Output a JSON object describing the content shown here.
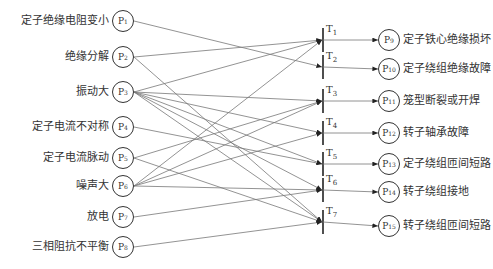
{
  "inputs": [
    {
      "id": "P1",
      "label": "定子绝缘电阻变小",
      "y": 21
    },
    {
      "id": "P2",
      "label": "绝缘分解",
      "y": 57
    },
    {
      "id": "P3",
      "label": "振动大",
      "y": 92
    },
    {
      "id": "P4",
      "label": "定子电流不对称",
      "y": 127
    },
    {
      "id": "P5",
      "label": "定子电流脉动",
      "y": 158
    },
    {
      "id": "P6",
      "label": "噪声大",
      "y": 186
    },
    {
      "id": "P7",
      "label": "放电",
      "y": 217
    },
    {
      "id": "P8",
      "label": "三相阻抗不平衡",
      "y": 247
    }
  ],
  "transitions": [
    {
      "id": "T1",
      "y": 40
    },
    {
      "id": "T2",
      "y": 67
    },
    {
      "id": "T3",
      "y": 101
    },
    {
      "id": "T4",
      "y": 133
    },
    {
      "id": "T5",
      "y": 164
    },
    {
      "id": "T6",
      "y": 190
    },
    {
      "id": "T7",
      "y": 222
    }
  ],
  "outputs": [
    {
      "id": "P9",
      "label": "定子铁心绝缘损坏",
      "y": 40
    },
    {
      "id": "P10",
      "label": "定子绕组绝缘故障",
      "y": 69
    },
    {
      "id": "P11",
      "label": "笼型断裂或开焊",
      "y": 101
    },
    {
      "id": "P12",
      "label": "转子轴承故障",
      "y": 133
    },
    {
      "id": "P13",
      "label": "定子绕组匝间短路",
      "y": 164
    },
    {
      "id": "P14",
      "label": "转子绕组接地",
      "y": 192
    },
    {
      "id": "P15",
      "label": "转子绕组匝间短路",
      "y": 226
    }
  ],
  "arcs": [
    [
      "P1",
      "T2"
    ],
    [
      "P2",
      "T1"
    ],
    [
      "P2",
      "T7"
    ],
    [
      "P3",
      "T1"
    ],
    [
      "P3",
      "T3"
    ],
    [
      "P3",
      "T4"
    ],
    [
      "P3",
      "T5"
    ],
    [
      "P3",
      "T6"
    ],
    [
      "P3",
      "T7"
    ],
    [
      "P4",
      "T5"
    ],
    [
      "P5",
      "T3"
    ],
    [
      "P5",
      "T7"
    ],
    [
      "P6",
      "T1"
    ],
    [
      "P6",
      "T3"
    ],
    [
      "P6",
      "T4"
    ],
    [
      "P6",
      "T6"
    ],
    [
      "P7",
      "T6"
    ],
    [
      "P8",
      "T7"
    ]
  ]
}
